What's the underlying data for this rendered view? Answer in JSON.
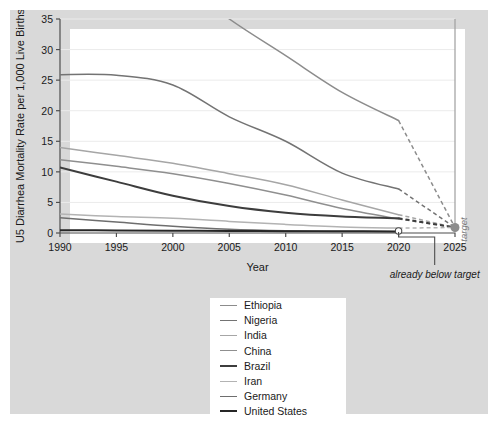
{
  "chart_data": {
    "type": "line",
    "title": "",
    "xlabel": "Year",
    "ylabel": "U5 Diarrhea Mortality Rate per 1,000 Live Births",
    "xlim": [
      1990,
      2025
    ],
    "ylim": [
      0,
      35
    ],
    "xticks": [
      "1990",
      "1995",
      "2000",
      "2005",
      "2010",
      "2015",
      "2020",
      "2025"
    ],
    "yticks": [
      "0",
      "5",
      "10",
      "15",
      "20",
      "25",
      "30",
      "35"
    ],
    "grid": true,
    "legend_position": "below-center",
    "x": [
      1990,
      1995,
      2000,
      2005,
      2010,
      2015,
      2020
    ],
    "series": [
      {
        "name": "Ethiopia",
        "color": "#8c8c8c",
        "width": 1.5,
        "values": [
          60.0,
          52.0,
          42.0,
          35.0,
          29.0,
          23.0,
          18.4
        ],
        "projection": {
          "x": [
            2020,
            2025
          ],
          "values": [
            18.4,
            0.9
          ]
        }
      },
      {
        "name": "Nigeria",
        "color": "#737373",
        "width": 1.5,
        "values": [
          25.9,
          25.8,
          24.2,
          19.0,
          15.0,
          9.8,
          7.2
        ],
        "projection": {
          "x": [
            2020,
            2025
          ],
          "values": [
            7.2,
            0.9
          ]
        }
      },
      {
        "name": "India",
        "color": "#a6a6a6",
        "width": 1.5,
        "values": [
          14.0,
          12.7,
          11.4,
          9.7,
          7.9,
          5.4,
          3.0
        ],
        "projection": {
          "x": [
            2020,
            2025
          ],
          "values": [
            3.0,
            0.9
          ]
        }
      },
      {
        "name": "China",
        "color": "#8f8f8f",
        "width": 1.5,
        "values": [
          12.0,
          10.9,
          9.7,
          8.1,
          6.2,
          4.0,
          2.3
        ],
        "projection": {
          "x": [
            2020,
            2025
          ],
          "values": [
            2.3,
            0.9
          ]
        }
      },
      {
        "name": "Brazil",
        "color": "#3d3d3d",
        "width": 2.0,
        "values": [
          10.7,
          8.4,
          6.1,
          4.4,
          3.3,
          2.7,
          2.4
        ],
        "projection": {
          "x": [
            2020,
            2025
          ],
          "values": [
            2.4,
            0.9
          ]
        }
      },
      {
        "name": "Iran",
        "color": "#b3b3b3",
        "width": 1.5,
        "values": [
          3.1,
          2.7,
          2.4,
          1.9,
          1.4,
          1.0,
          0.8
        ],
        "projection": {
          "x": [
            2020,
            2025
          ],
          "values": [
            0.8,
            0.9
          ]
        }
      },
      {
        "name": "Germany",
        "color": "#6e6e6e",
        "width": 1.5,
        "values": [
          2.5,
          1.8,
          1.1,
          0.6,
          0.35,
          0.25,
          0.2
        ],
        "projection": null
      },
      {
        "name": "United States",
        "color": "#262626",
        "width": 2.0,
        "values": [
          0.45,
          0.42,
          0.38,
          0.33,
          0.3,
          0.28,
          0.26
        ],
        "projection": null
      }
    ],
    "annotations": [
      {
        "name": "target-marker",
        "label": "target",
        "x": 2025,
        "y": 0.9
      },
      {
        "name": "already-below-target",
        "label": "already below target",
        "x": 2020,
        "y": 0.3
      }
    ]
  },
  "legend": {
    "items": [
      {
        "label": "Ethiopia"
      },
      {
        "label": "Nigeria"
      },
      {
        "label": "India"
      },
      {
        "label": "China"
      },
      {
        "label": "Brazil"
      },
      {
        "label": "Iran"
      },
      {
        "label": "Germany"
      },
      {
        "label": "United States"
      }
    ]
  },
  "colors": {
    "panel": "#d9d9d9",
    "plot": "#ffffff",
    "axis": "#4d4d4d",
    "grid": "#ebebeb",
    "target": "#8c8c8c"
  }
}
